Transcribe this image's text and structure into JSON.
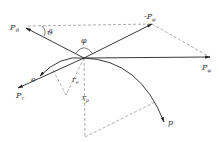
{
  "diagram": {
    "labels": {
      "p_theta": "P",
      "p_theta_sub": "ϑ",
      "neg_p_phi": "-P",
      "neg_p_phi_sub": "φ",
      "p_phi": "P",
      "p_phi_sub": "φ",
      "p_r": "P",
      "p_r_sub": "r",
      "e": "e",
      "r_e": "r",
      "r_e_sub": "e",
      "r_p": "r",
      "r_p_sub": "p",
      "p": "p",
      "theta_angle": "ϑ",
      "phi_angle": "φ"
    },
    "colors": {
      "stroke": "#333333",
      "dashed": "#888888"
    }
  }
}
